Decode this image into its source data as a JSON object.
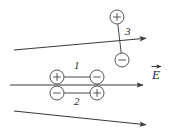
{
  "figure": {
    "background_color": "#ffffff",
    "line_color": "#3a3a3a",
    "charge_outline_color": "#555555",
    "text_color": "#2b2b2b",
    "width": 169,
    "height": 137
  },
  "field": {
    "label": "E",
    "label_is_vector": true,
    "direction": "right",
    "lines": [
      {
        "name": "upper-field-line",
        "x1": 14,
        "y1": 50,
        "x2": 148,
        "y2": 38
      },
      {
        "name": "middle-field-line",
        "x1": 10,
        "y1": 85,
        "x2": 145,
        "y2": 85
      },
      {
        "name": "lower-field-line",
        "x1": 14,
        "y1": 111,
        "x2": 148,
        "y2": 125
      }
    ]
  },
  "dipoles": [
    {
      "id": "1",
      "label": "1",
      "label_position": "above",
      "orientation": "horizontal",
      "aligned_with_field": true,
      "charges": [
        {
          "sign": "+",
          "symbol": "+",
          "x": 57,
          "y": 77
        },
        {
          "sign": "-",
          "symbol": "−",
          "x": 97,
          "y": 77
        }
      ],
      "label_x": 77,
      "label_y": 63
    },
    {
      "id": "2",
      "label": "2",
      "label_position": "below",
      "orientation": "horizontal",
      "aligned_with_field": false,
      "charges": [
        {
          "sign": "-",
          "symbol": "−",
          "x": 57,
          "y": 93
        },
        {
          "sign": "+",
          "symbol": "+",
          "x": 97,
          "y": 93
        }
      ],
      "label_x": 77,
      "label_y": 97
    },
    {
      "id": "3",
      "label": "3",
      "label_position": "right",
      "orientation": "vertical",
      "aligned_with_field": false,
      "charges": [
        {
          "sign": "+",
          "symbol": "+",
          "x": 117,
          "y": 17
        },
        {
          "sign": "-",
          "symbol": "−",
          "x": 122,
          "y": 60
        }
      ],
      "label_x": 126,
      "label_y": 26
    }
  ],
  "field_label_position": {
    "x": 152,
    "y": 76
  }
}
